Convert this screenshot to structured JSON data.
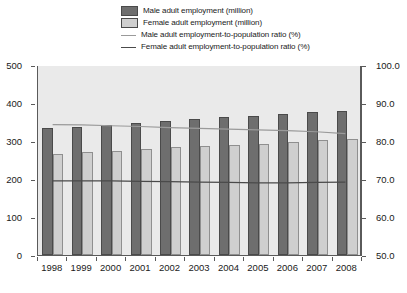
{
  "legend": {
    "items": [
      {
        "label": "Male adult employment (million)",
        "key": "swatch",
        "icon": "legend-swatch-dark",
        "color": "#6e6e6e"
      },
      {
        "label": "Female adult employment (million)",
        "key": "swatch",
        "icon": "legend-swatch-light",
        "color": "#cfcfcf"
      },
      {
        "label": "Male adult employment-to-population ratio (%)",
        "key": "line",
        "icon": "legend-line-light",
        "color": "#9a9a9a"
      },
      {
        "label": "Female adult employment-to-population ratio (%)",
        "key": "line",
        "icon": "legend-line-dark",
        "color": "#4a4a4a"
      }
    ]
  },
  "axes": {
    "left_ticks": [
      "500",
      "400",
      "300",
      "200",
      "100",
      "0"
    ],
    "right_ticks": [
      "100.0",
      "90.0",
      "80.0",
      "70.0",
      "60.0",
      "50.0"
    ]
  },
  "chart_data": {
    "type": "bar",
    "title": "",
    "subtitle": "",
    "xlabel": "",
    "ylabel": "",
    "y2label": "",
    "grid": false,
    "legend_position": "top-center",
    "categories": [
      "1998",
      "1999",
      "2000",
      "2001",
      "2002",
      "2003",
      "2004",
      "2005",
      "2006",
      "2007",
      "2008"
    ],
    "ylim": [
      0,
      500
    ],
    "y2lim": [
      50.0,
      100.0
    ],
    "series": [
      {
        "name": "Male adult employment (million)",
        "type": "bar",
        "axis": "left",
        "color": "#6e6e6e",
        "values": [
          333,
          338,
          342,
          348,
          353,
          358,
          362,
          366,
          371,
          376,
          378
        ]
      },
      {
        "name": "Female adult employment (million)",
        "type": "bar",
        "axis": "left",
        "color": "#cfcfcf",
        "values": [
          265,
          270,
          275,
          279,
          283,
          287,
          289,
          293,
          298,
          303,
          305
        ]
      },
      {
        "name": "Male adult employment-to-population ratio (%)",
        "type": "line",
        "axis": "right",
        "color": "#9a9a9a",
        "values": [
          84.5,
          84.4,
          84.2,
          84.0,
          83.7,
          83.5,
          83.3,
          83.1,
          82.9,
          82.6,
          82.1
        ]
      },
      {
        "name": "Female adult employment-to-population ratio (%)",
        "type": "line",
        "axis": "right",
        "color": "#4a4a4a",
        "values": [
          69.6,
          69.6,
          69.6,
          69.5,
          69.4,
          69.3,
          69.2,
          69.1,
          69.1,
          69.2,
          69.3
        ]
      }
    ]
  }
}
